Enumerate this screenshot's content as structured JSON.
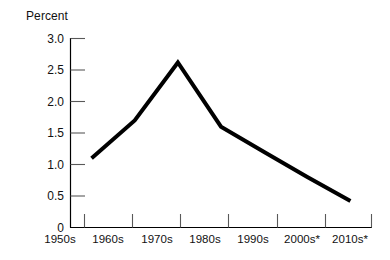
{
  "chart_data": {
    "type": "line",
    "title": "",
    "subtitle": "",
    "xlabel": "",
    "ylabel": "Percent",
    "categories": [
      "1950s",
      "1960s",
      "1970s",
      "1980s",
      "1990s",
      "2000s*",
      "2010s*"
    ],
    "values": [
      1.1,
      1.7,
      2.62,
      1.6,
      1.2,
      0.8,
      0.42
    ],
    "series": [
      {
        "name": "Percent",
        "values": [
          1.1,
          1.7,
          2.62,
          1.6,
          1.2,
          0.8,
          0.42
        ],
        "color": "#000000"
      }
    ],
    "ylim": [
      0,
      3.0
    ],
    "yticks": [
      0,
      0.5,
      1.0,
      1.5,
      2.0,
      2.5,
      3.0
    ],
    "ytick_labels": [
      "0",
      "0.5",
      "1.0",
      "1.5",
      "2.0",
      "2.5",
      "3.0"
    ],
    "grid": false,
    "legend": false,
    "legend_position": "none",
    "markers": false,
    "line_width_px": 4,
    "annotations": [],
    "footnote": ""
  },
  "axes": {
    "y_title": "Percent",
    "y_labels": [
      "3.0",
      "2.5",
      "2.0",
      "1.5",
      "1.0",
      "0.5",
      "0"
    ],
    "x_labels": [
      "1950s",
      "1960s",
      "1970s",
      "1980s",
      "1990s",
      "2000s*",
      "2010s*"
    ]
  },
  "style": {
    "background": "#ffffff",
    "line_color": "#000000",
    "axis_color": "#000000",
    "tick_color": "#595959",
    "text_color": "#111111"
  }
}
